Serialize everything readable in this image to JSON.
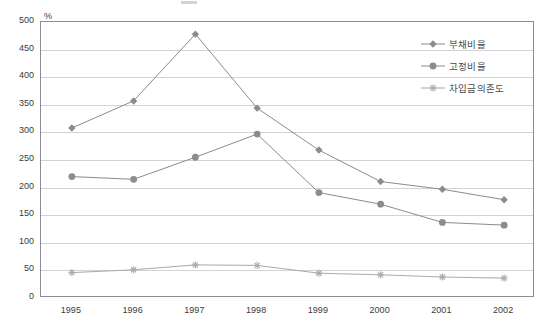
{
  "axis": {
    "unit_label": "%",
    "y_ticks": [
      "500",
      "450",
      "400",
      "350",
      "300",
      "250",
      "200",
      "150",
      "100",
      "50",
      "0"
    ],
    "x_ticks": [
      "1995",
      "1996",
      "1997",
      "1998",
      "1999",
      "2000",
      "2001",
      "2002"
    ]
  },
  "legend": {
    "items": [
      {
        "label": "부채비율",
        "marker": "diamond-marker",
        "color": "#8b8b91"
      },
      {
        "label": "고정비율",
        "marker": "circle-marker",
        "color": "#8b8b91"
      },
      {
        "label": "차입금의존도",
        "marker": "asterisk-marker",
        "color": "#a9a9af"
      }
    ]
  },
  "chart_data": {
    "type": "line",
    "title": "",
    "xlabel": "",
    "ylabel": "%",
    "ylim": [
      0,
      500
    ],
    "ytick_step": 50,
    "grid": true,
    "legend_position": "top-right-inside",
    "categories": [
      "1995",
      "1996",
      "1997",
      "1998",
      "1999",
      "2000",
      "2001",
      "2002"
    ],
    "series": [
      {
        "name": "부채비율",
        "marker": "diamond",
        "color": "#8b8b91",
        "values": [
          308,
          357,
          478,
          344,
          268,
          211,
          197,
          178
        ]
      },
      {
        "name": "고정비율",
        "marker": "circle",
        "color": "#8b8b91",
        "values": [
          220,
          215,
          255,
          297,
          191,
          170,
          137,
          132
        ]
      },
      {
        "name": "차입금의존도",
        "marker": "asterisk",
        "color": "#a9a9af",
        "values": [
          46,
          51,
          60,
          59,
          45,
          42,
          38,
          36
        ]
      }
    ]
  }
}
